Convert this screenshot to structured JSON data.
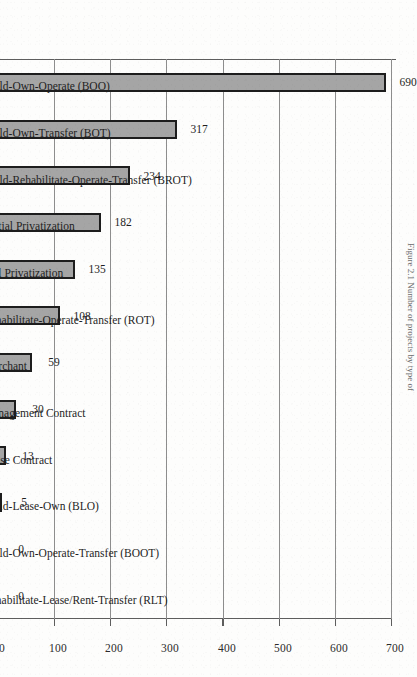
{
  "figure": {
    "orientation": "rotated-90-clockwise",
    "caption_clipped": "Figure 2.1 Number of projects by type of",
    "bar_fill_color": "#a5a5a5",
    "bar_border_color": "#1d1d1d",
    "gridline_color": "#8d8d8d",
    "axis_color": "#5d5d5d"
  },
  "chart_data": {
    "type": "bar",
    "title": "",
    "xlabel": "",
    "ylabel": "",
    "ylim": [
      0,
      700
    ],
    "yticks": [
      0,
      100,
      200,
      300,
      400,
      500,
      600,
      700
    ],
    "ytick_labels": [
      "0",
      "100",
      "200",
      "300",
      "400",
      "500",
      "600",
      "700"
    ],
    "grid": true,
    "legend": false,
    "orientation": "vertical-bars",
    "categories": [
      "Build-Own-Operate (BOO)",
      "Build-Own-Transfer (BOT)",
      "Build-Rehabilitate-Operate-Transfer (BROT)",
      "Partial Privatization",
      "Full Privatization",
      "Rehabilitate-Operate-Transfer (ROT)",
      "Merchant",
      "Management Contract",
      "Lease Contract",
      "Build-Lease-Own (BLO)",
      "Build-Own-Operate-Transfer (BOOT)",
      "Rehabilitate-Lease/Rent-Transfer (RLT)"
    ],
    "values": [
      690,
      317,
      234,
      182,
      135,
      108,
      59,
      30,
      13,
      5,
      0,
      0
    ],
    "data_labels": [
      "690",
      "317",
      "234",
      "182",
      "135",
      "108",
      "59",
      "30",
      "13",
      "5",
      "0",
      "0"
    ]
  }
}
